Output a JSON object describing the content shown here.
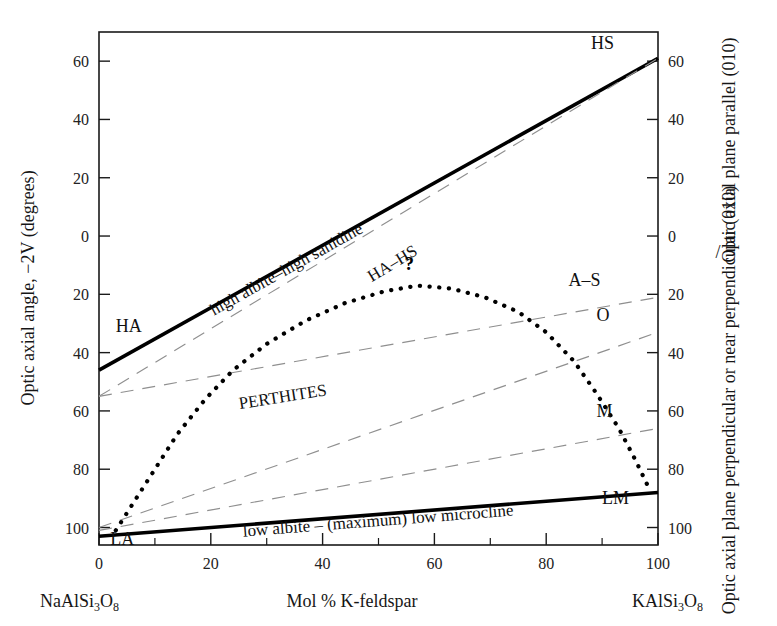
{
  "chart_data": {
    "type": "line",
    "title": "",
    "xlabel": "Mol % K-feldspar",
    "ylabel": "Optic axial angle, −2V (degrees)",
    "xlim": [
      0,
      100
    ],
    "ylim_top": 70,
    "grid": false,
    "x_ticks": [
      "0",
      "20",
      "40",
      "60",
      "80",
      "100"
    ],
    "x_tick_values": [
      0,
      20,
      40,
      60,
      80,
      100
    ],
    "x_minor_values": [
      10,
      30,
      50,
      70,
      90
    ],
    "y_ticks": [
      "60",
      "40",
      "20",
      "0",
      "20",
      "40",
      "60",
      "80",
      "100"
    ],
    "y_tick_values": [
      -60,
      -40,
      -20,
      0,
      20,
      40,
      60,
      80,
      100
    ],
    "right_ylabel_upper": "Optic axial plane parallel (010)",
    "right_ylabel_lower": "Optic axial plane perpendicular or near perpendicular (010)",
    "right_label_separator": "/",
    "x_left_endmember": "NaAlSi3O8",
    "x_right_endmember": "KAlSi3O8",
    "series": [
      {
        "name": "high albite–high sanidine",
        "style": "solid",
        "label": "high albite–high sanidine",
        "label_left_cap": "HA",
        "label_right_cap": "HS",
        "points": [
          [
            0,
            46
          ],
          [
            100,
            -61
          ]
        ]
      },
      {
        "name": "low albite – (maximum) low microcline",
        "style": "solid",
        "label": "low albite – (maximum) low microcline",
        "label_left_cap": "LA",
        "label_right_cap": "LM",
        "points": [
          [
            0,
            103
          ],
          [
            100,
            88
          ]
        ]
      },
      {
        "name": "HA–HS",
        "style": "dashed",
        "label": "HA–HS",
        "points": [
          [
            0,
            55
          ],
          [
            100,
            -61
          ]
        ]
      },
      {
        "name": "A–S",
        "style": "dashed",
        "label": "A–S",
        "points": [
          [
            0,
            55
          ],
          [
            100,
            21
          ]
        ]
      },
      {
        "name": "O",
        "style": "dashed",
        "label": "O",
        "points": [
          [
            0,
            100
          ],
          [
            100,
            33
          ]
        ]
      },
      {
        "name": "M",
        "style": "dashed",
        "label": "M",
        "points": [
          [
            0,
            101
          ],
          [
            100,
            66
          ]
        ]
      },
      {
        "name": "PERTHITES",
        "style": "dotted",
        "label": "PERTHITES",
        "annotation": "?",
        "points": [
          [
            3,
            101
          ],
          [
            6,
            92
          ],
          [
            10,
            80
          ],
          [
            14,
            68
          ],
          [
            19,
            56
          ],
          [
            24,
            46
          ],
          [
            30,
            37
          ],
          [
            37,
            29
          ],
          [
            44,
            23
          ],
          [
            51,
            19
          ],
          [
            57,
            17
          ],
          [
            63,
            18
          ],
          [
            69,
            21
          ],
          [
            75,
            26
          ],
          [
            80,
            33
          ],
          [
            85,
            43
          ],
          [
            89,
            54
          ],
          [
            93,
            66
          ],
          [
            96,
            77
          ],
          [
            98,
            85
          ]
        ]
      }
    ],
    "curve_labels": {
      "perthites": "PERTHITES",
      "ha_hs": "HA–HS",
      "high_albite_high_sanidine": "high albite–high sanidine",
      "low_albite_low_microcline": "low albite – (maximum) low microcline",
      "question_mark": "?"
    },
    "end_labels": {
      "ha": "HA",
      "hs": "HS",
      "la": "LA",
      "lm": "LM",
      "as": "A–S",
      "o": "O",
      "m": "M"
    },
    "colors": {
      "axis": "#1a1a1a",
      "solid_curve": "#000000",
      "dashed_curve": "#8f8f8f",
      "dotted_curve": "#000000",
      "text": "#161616",
      "background": "#ffffff"
    }
  }
}
